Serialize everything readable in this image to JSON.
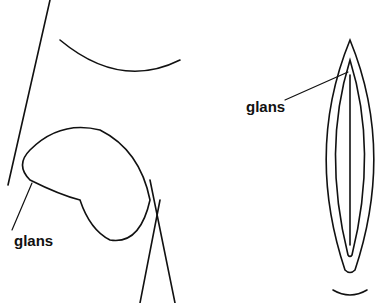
{
  "diagram": {
    "type": "anatomical-line-drawing",
    "panels": [
      {
        "id": "left",
        "label": "glans"
      },
      {
        "id": "right",
        "label": "glans"
      }
    ],
    "colors": {
      "stroke": "#111111",
      "background": "#ffffff"
    }
  }
}
